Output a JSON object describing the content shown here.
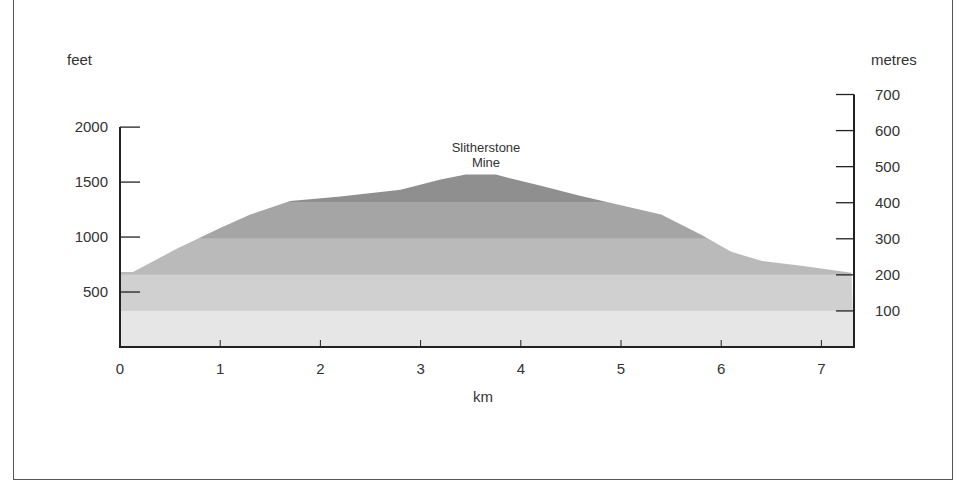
{
  "chart_data": {
    "type": "area",
    "title": "",
    "xlabel": "km",
    "ylabel_left": "feet",
    "ylabel_right": "metres",
    "x_ticks": [
      "0",
      "1",
      "2",
      "3",
      "4",
      "5",
      "6",
      "7"
    ],
    "y_left_ticks": [
      "500",
      "1000",
      "1500",
      "2000"
    ],
    "y_right_ticks": [
      "100",
      "200",
      "300",
      "400",
      "500",
      "600",
      "700"
    ],
    "xlim": [
      0,
      7.3
    ],
    "ylim_metres": [
      0,
      700
    ],
    "ylim_feet": [
      0,
      2000
    ],
    "annotations": [
      {
        "text": "Slitherstone\nMine",
        "line1": "Slitherstone",
        "line2": "Mine",
        "x_km": 3.65,
        "y_m": 480
      }
    ],
    "elevation_bands_m": [
      {
        "from": 0,
        "to": 100,
        "color": "#e6e6e6"
      },
      {
        "from": 100,
        "to": 200,
        "color": "#d0d0d0"
      },
      {
        "from": 200,
        "to": 300,
        "color": "#bababa"
      },
      {
        "from": 300,
        "to": 400,
        "color": "#a5a5a5"
      },
      {
        "from": 400,
        "to": 700,
        "color": "#8f8f8f"
      }
    ],
    "series": [
      {
        "name": "Elevation profile (metres)",
        "x": [
          0,
          0.13,
          0.55,
          1.0,
          1.3,
          1.7,
          2.2,
          2.8,
          3.2,
          3.45,
          3.75,
          4.2,
          4.6,
          5.4,
          5.8,
          6.1,
          6.4,
          6.8,
          7.3
        ],
        "values": [
          208,
          208,
          270,
          330,
          367,
          405,
          417,
          436,
          464,
          478,
          478,
          447,
          419,
          367,
          311,
          264,
          239,
          225,
          206
        ]
      }
    ],
    "grid": false,
    "legend": "none"
  }
}
